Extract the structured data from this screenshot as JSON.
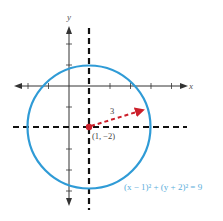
{
  "diagram": {
    "axes": {
      "x_label": "x",
      "y_label": "y"
    },
    "center": {
      "label": "(1, −2)",
      "x": 1,
      "y": -2
    },
    "radius": {
      "label": "3",
      "value": 3
    },
    "equation": "(x − 1)² + (y + 2)² = 9",
    "colors": {
      "circle": "#2f9bd6",
      "radius": "#cc1f2a",
      "center": "#cc1f2a",
      "dashed": "#111111",
      "equation": "#5aaedb",
      "axes": "#333333"
    }
  }
}
